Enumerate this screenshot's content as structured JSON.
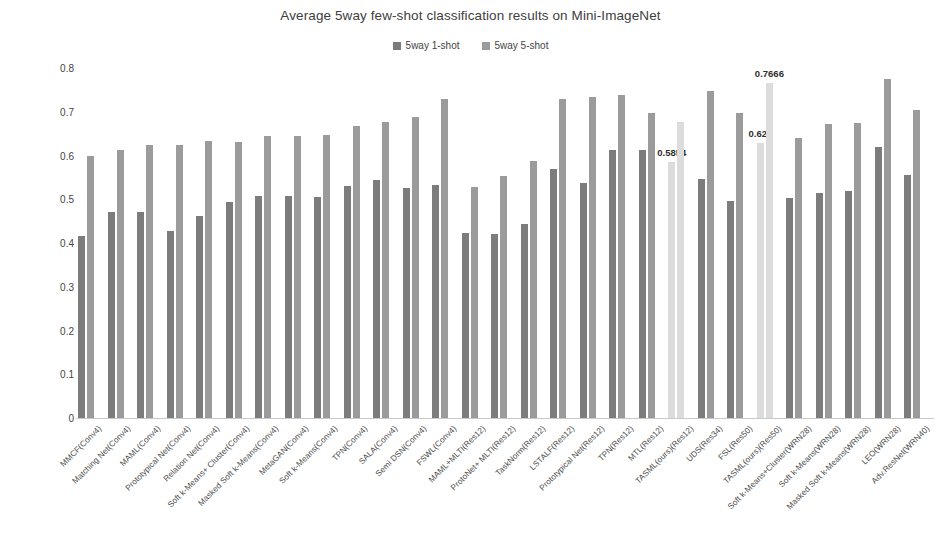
{
  "chart_data": {
    "type": "bar",
    "title": "Average 5way few-shot classification results on Mini-ImageNet",
    "xlabel": "",
    "ylabel": "",
    "ylim": [
      0,
      0.8
    ],
    "ytick_labels": [
      "0",
      "0.1",
      "0.2",
      "0.3",
      "0.4",
      "0.5",
      "0.6",
      "0.7",
      "0.8"
    ],
    "ytick_values": [
      0,
      0.1,
      0.2,
      0.3,
      0.4,
      0.5,
      0.6,
      0.7,
      0.8
    ],
    "grid": false,
    "legend_position": "top-center",
    "categories": [
      "MMCF(Conv4)",
      "Matching Net(Conv4)",
      "MAML(Conv4)",
      "Prototypical Net(Conv4)",
      "Relation Net(Conv4)",
      "Soft k-Means+ Cluster(Conv4)",
      "Masked Soft k-Means(Conv4)",
      "MetaGAN(Conv4)",
      "Soft k-Means(Conv4)",
      "TPN(Conv4)",
      "SALA(Conv4)",
      "Semi DSN(Conv4)",
      "FSWL(Conv4)",
      "MAML+MLTI(Res12)",
      "ProtoNet+ MLTI(Res12)",
      "TaskNorm(Res12)",
      "LSTALF(Res12)",
      "Prototypical Net(Res12)",
      "TPN(Res12)",
      "MTL(Res12)",
      "TASML(ours)(Res12)",
      "UDS(Res34)",
      "FSL(Res50)",
      "TASML(ours)(Res50)",
      "Soft k-Means+Cluster(WRN28)",
      "Soft k-Means(WRN28)",
      "Masked Soft k-Means(WRN28)",
      "LEO(WRN28)",
      "Adv.ResNet(WRN40)"
    ],
    "series": [
      {
        "name": "5way 1-shot",
        "color": "#7c7c7c",
        "values": [
          0.415,
          0.47,
          0.47,
          0.428,
          0.462,
          0.493,
          0.508,
          0.508,
          0.505,
          0.53,
          0.545,
          0.525,
          0.532,
          0.422,
          0.42,
          0.443,
          0.57,
          0.538,
          0.612,
          0.612,
          0.5854,
          0.546,
          0.497,
          0.628,
          0.503,
          0.515,
          0.52,
          0.62,
          0.555
        ]
      },
      {
        "name": "5way 5-shot",
        "color": "#9b9b9b",
        "values": [
          0.6,
          0.612,
          0.623,
          0.624,
          0.634,
          0.632,
          0.645,
          0.645,
          0.648,
          0.667,
          0.676,
          0.687,
          0.73,
          0.527,
          0.553,
          0.588,
          0.73,
          0.733,
          0.738,
          0.697,
          0.6766,
          0.748,
          0.697,
          0.7666,
          0.64,
          0.672,
          0.675,
          0.775,
          0.705
        ]
      }
    ],
    "highlight_color": "#dcdcdc",
    "highlighted_categories": [
      "TASML(ours)(Res12)",
      "TASML(ours)(Res50)"
    ],
    "data_labels": [
      {
        "category": "TASML(ours)(Res12)",
        "series": "5way 1-shot",
        "text": "0.5854"
      },
      {
        "category": "TASML(ours)(Res50)",
        "series": "5way 1-shot",
        "text": "0.628"
      },
      {
        "category": "TASML(ours)(Res50)",
        "series": "5way 5-shot",
        "text": "0.7666"
      }
    ]
  },
  "legend": {
    "items": [
      {
        "label": "5way 1-shot",
        "color": "#7c7c7c"
      },
      {
        "label": "5way 5-shot",
        "color": "#9b9b9b"
      }
    ]
  }
}
